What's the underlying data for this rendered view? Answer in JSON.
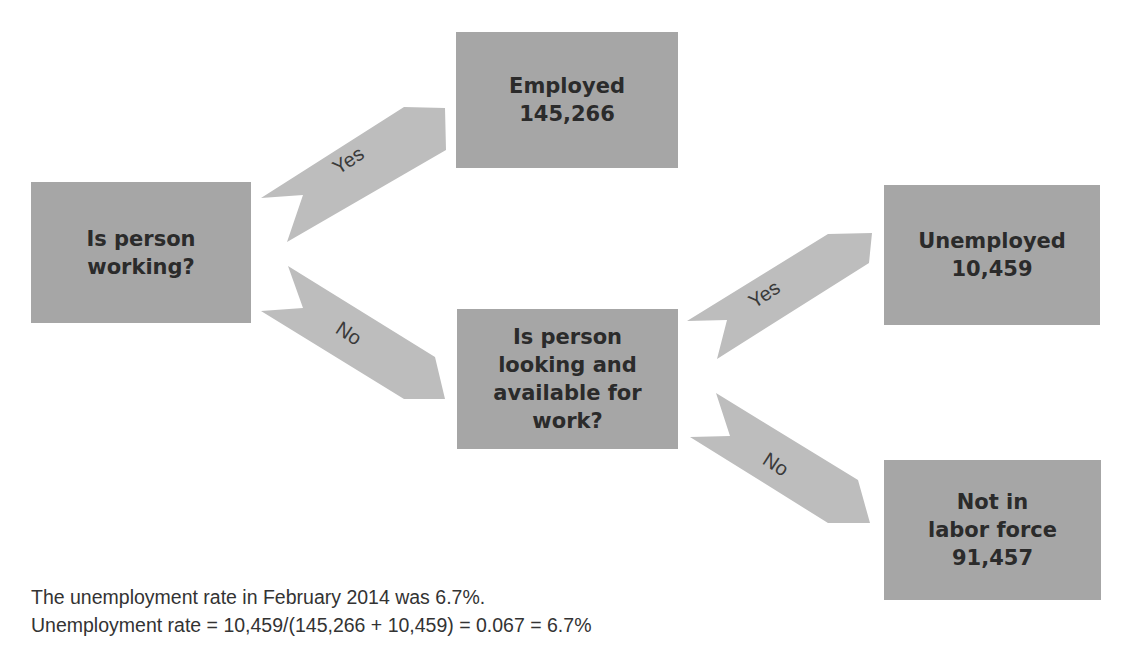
{
  "nodes": {
    "start": {
      "label": "Is person\nworking?"
    },
    "employed": {
      "label": "Employed\n145,266"
    },
    "looking": {
      "label": "Is person\nlooking and\navailable for\nwork?"
    },
    "unemployed": {
      "label": "Unemployed\n10,459"
    },
    "not_in_labor_force": {
      "label": "Not in\nlabor force\n91,457"
    }
  },
  "edges": [
    {
      "from": "start",
      "to": "employed",
      "label": "Yes"
    },
    {
      "from": "start",
      "to": "looking",
      "label": "No"
    },
    {
      "from": "looking",
      "to": "unemployed",
      "label": "Yes"
    },
    {
      "from": "looking",
      "to": "not_in_labor_force",
      "label": "No"
    }
  ],
  "caption": {
    "line1": "The unemployment rate in February 2014 was 6.7%.",
    "line2": "Unemployment rate = 10,459/(145,266 + 10,459) = 0.067 = 6.7%"
  },
  "colors": {
    "box_fill": "#a6a6a6",
    "arrow_fill": "#bdbdbd",
    "text": "#2b2b2b"
  }
}
